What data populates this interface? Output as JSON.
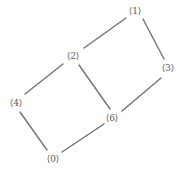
{
  "diagram": {
    "background_color": "#ffffff",
    "edge_color": "#737373",
    "label_color": "#595959",
    "edge_width": 1.4,
    "width": 188,
    "height": 176
  },
  "nodes": [
    {
      "id": "1",
      "label": "⟨1⟩",
      "x": 135,
      "y": 11
    },
    {
      "id": "2",
      "label": "⟨2⟩",
      "x": 73,
      "y": 56
    },
    {
      "id": "3",
      "label": "⟨3⟩",
      "x": 168,
      "y": 68
    },
    {
      "id": "4",
      "label": "⟨4⟩",
      "x": 16,
      "y": 103
    },
    {
      "id": "6",
      "label": "⟨6⟩",
      "x": 112,
      "y": 118
    },
    {
      "id": "0",
      "label": "⟨0⟩",
      "x": 53,
      "y": 159
    }
  ],
  "edges": [
    {
      "from": "2",
      "to": "1",
      "x1": 84,
      "y1": 48,
      "x2": 126,
      "y2": 18
    },
    {
      "from": "1",
      "to": "3",
      "x1": 143,
      "y1": 19,
      "x2": 164,
      "y2": 59
    },
    {
      "from": "2",
      "to": "6",
      "x1": 79,
      "y1": 65,
      "x2": 110,
      "y2": 109
    },
    {
      "from": "2",
      "to": "4",
      "x1": 63,
      "y1": 64,
      "x2": 25,
      "y2": 94
    },
    {
      "from": "6",
      "to": "3",
      "x1": 122,
      "y1": 111,
      "x2": 161,
      "y2": 78
    },
    {
      "from": "4",
      "to": "0",
      "x1": 20,
      "y1": 112,
      "x2": 47,
      "y2": 150
    },
    {
      "from": "0",
      "to": "6",
      "x1": 62,
      "y1": 152,
      "x2": 104,
      "y2": 124
    }
  ]
}
